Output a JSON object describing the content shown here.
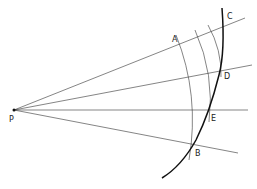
{
  "diagram": {
    "type": "geometric-construction",
    "labels": {
      "P": "P",
      "A": "A",
      "B": "B",
      "C": "C",
      "D": "D",
      "E": "E"
    },
    "points": {
      "P": [
        14,
        110
      ],
      "A": [
        184,
        43
      ],
      "B": [
        193,
        146
      ],
      "C": [
        223,
        27
      ],
      "D": [
        220,
        71
      ],
      "E": [
        209,
        111
      ]
    },
    "rays_from_P": [
      {
        "name": "ray-AC",
        "end": [
          245,
          18
        ]
      },
      {
        "name": "ray-D",
        "end": [
          252,
          65
        ]
      },
      {
        "name": "ray-E",
        "end": [
          248,
          110
        ]
      },
      {
        "name": "ray-B",
        "end": [
          238,
          153
        ]
      }
    ],
    "colors": {
      "line": "#333333",
      "curve": "#111111",
      "background": "#ffffff"
    }
  }
}
